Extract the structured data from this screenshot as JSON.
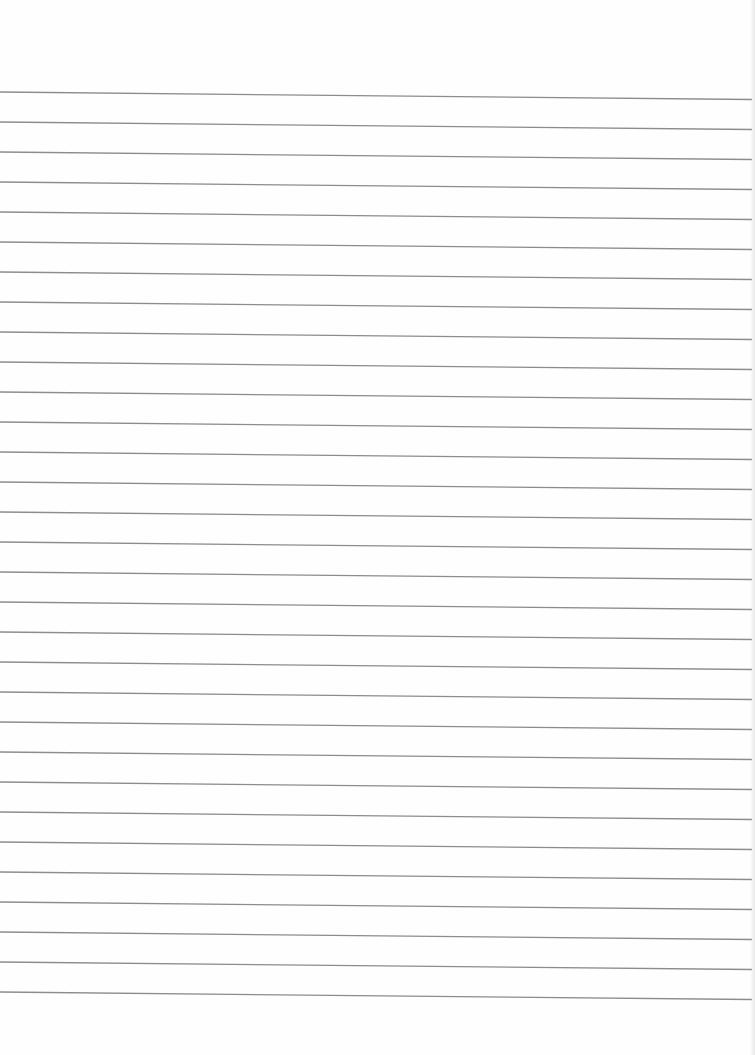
{
  "document": {
    "type": "lined-paper",
    "background_color": "#fefefe",
    "rule": {
      "count": 31,
      "first_y_left": 92,
      "first_y_right": 99.5,
      "spacing": 30,
      "x_start": 0,
      "x_end": 752,
      "color": "#8c8c8c",
      "thickness": 1.3
    },
    "text_content": []
  }
}
